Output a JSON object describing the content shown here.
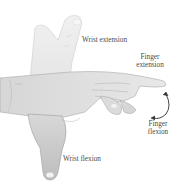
{
  "figure": {
    "type": "anatomical-illustration",
    "labels": {
      "wrist_extension": "Wrist extension",
      "finger_extension_line1": "Finger",
      "finger_extension_line2": "extension",
      "finger_flexion_line1": "Finger",
      "finger_flexion_line2": "flexion",
      "wrist_flexion": "Wrist flexion"
    },
    "colors": {
      "background": "#ffffff",
      "skin_light": "#e6e6e6",
      "skin_mid": "#d2d2d2",
      "skin_dark": "#b4b4b4",
      "outline": "#9a9a9a",
      "arrow": "#333333",
      "text": "#4a4a4a"
    }
  }
}
